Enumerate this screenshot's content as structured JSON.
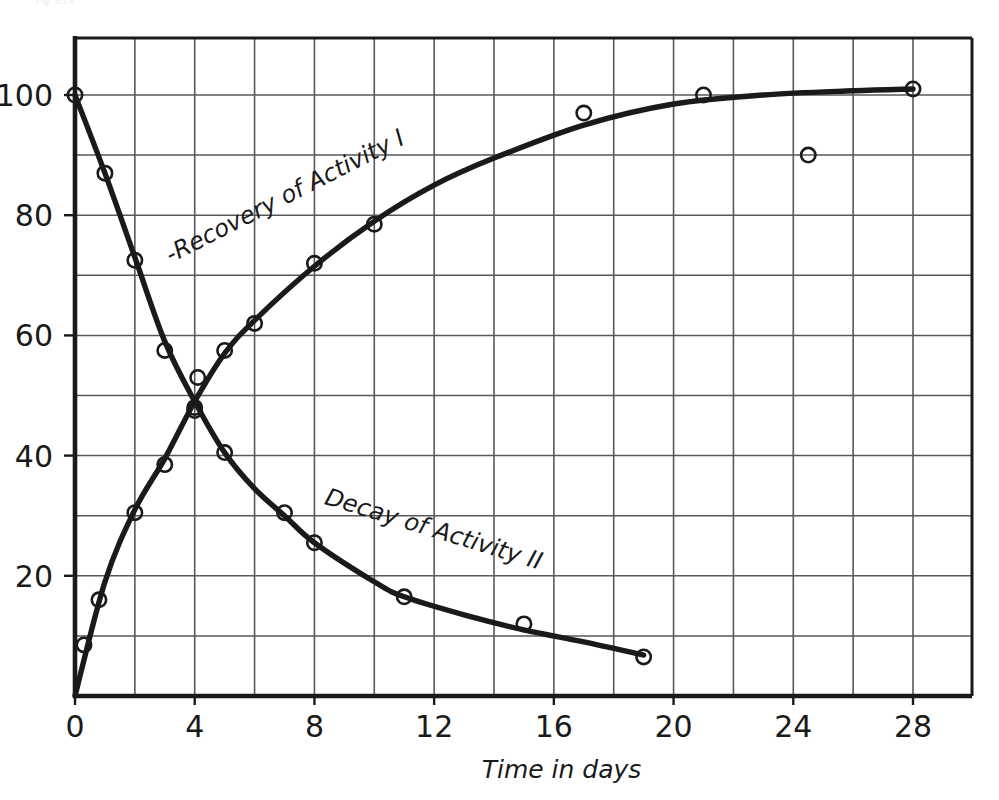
{
  "figure": {
    "faint_header": "Fig. 5.14",
    "background_color": "#ffffff",
    "ink_color": "#1a1a1a",
    "grid_color": "#58595b",
    "frame_color": "#1a1a1a"
  },
  "axes": {
    "x": {
      "title": "Time in days",
      "tick_labels": [
        "0",
        "4",
        "8",
        "12",
        "16",
        "20",
        "24",
        "28"
      ],
      "tick_values": [
        0,
        4,
        8,
        12,
        16,
        20,
        24,
        28
      ],
      "grid_step": 2,
      "range": [
        0,
        30
      ]
    },
    "y": {
      "title": "",
      "tick_labels": [
        "20",
        "40",
        "60",
        "80",
        "100"
      ],
      "tick_values": [
        20,
        40,
        60,
        80,
        100
      ],
      "grid_step": 10,
      "range": [
        0,
        110
      ]
    }
  },
  "annotations": [
    {
      "text": "-Recovery of Activity I",
      "x": 3.2,
      "y": 72,
      "rotation": -27
    },
    {
      "text": "Decay of Activity II",
      "x": 8.3,
      "y": 32,
      "rotation": 17
    }
  ],
  "chart_data": {
    "type": "scatter",
    "title": "",
    "subtitle": "",
    "xlabel": "Time in days",
    "ylabel": "",
    "xlim": [
      0,
      30
    ],
    "ylim": [
      0,
      110
    ],
    "grid": true,
    "legend": "inline-curve-labels",
    "marker": "open-circle",
    "series": [
      {
        "name": "Recovery of Activity I",
        "marker": "open-circle",
        "line": "smooth-rising-exponential",
        "points": [
          {
            "x": 0.3,
            "y": 8.5
          },
          {
            "x": 0.8,
            "y": 16
          },
          {
            "x": 2.0,
            "y": 30.5
          },
          {
            "x": 3.0,
            "y": 38.5
          },
          {
            "x": 4.0,
            "y": 47.5
          },
          {
            "x": 4.1,
            "y": 53
          },
          {
            "x": 5.0,
            "y": 57.5
          },
          {
            "x": 6.0,
            "y": 62
          },
          {
            "x": 8.0,
            "y": 72
          },
          {
            "x": 10.0,
            "y": 78.5
          },
          {
            "x": 17.0,
            "y": 97
          },
          {
            "x": 21.0,
            "y": 100
          },
          {
            "x": 24.5,
            "y": 90
          },
          {
            "x": 28.0,
            "y": 101
          }
        ],
        "curve": [
          {
            "x": 0.0,
            "y": 0
          },
          {
            "x": 1.0,
            "y": 19
          },
          {
            "x": 2.0,
            "y": 31
          },
          {
            "x": 3.0,
            "y": 39.5
          },
          {
            "x": 4.0,
            "y": 49
          },
          {
            "x": 5.0,
            "y": 57
          },
          {
            "x": 6.0,
            "y": 62.5
          },
          {
            "x": 8.0,
            "y": 71.5
          },
          {
            "x": 10.0,
            "y": 79
          },
          {
            "x": 12.0,
            "y": 85
          },
          {
            "x": 14.0,
            "y": 89.5
          },
          {
            "x": 17.0,
            "y": 95
          },
          {
            "x": 20.0,
            "y": 98.5
          },
          {
            "x": 23.0,
            "y": 100
          },
          {
            "x": 26.0,
            "y": 100.7
          },
          {
            "x": 28.0,
            "y": 101
          }
        ]
      },
      {
        "name": "Decay of Activity II",
        "marker": "open-circle",
        "line": "smooth-falling-exponential",
        "points": [
          {
            "x": 0.0,
            "y": 100
          },
          {
            "x": 1.0,
            "y": 87
          },
          {
            "x": 2.0,
            "y": 72.5
          },
          {
            "x": 3.0,
            "y": 57.5
          },
          {
            "x": 4.0,
            "y": 48
          },
          {
            "x": 5.0,
            "y": 40.5
          },
          {
            "x": 7.0,
            "y": 30.5
          },
          {
            "x": 8.0,
            "y": 25.5
          },
          {
            "x": 11.0,
            "y": 16.5
          },
          {
            "x": 15.0,
            "y": 12
          },
          {
            "x": 19.0,
            "y": 6.5
          }
        ],
        "curve": [
          {
            "x": 0.0,
            "y": 100
          },
          {
            "x": 1.0,
            "y": 87
          },
          {
            "x": 2.0,
            "y": 73
          },
          {
            "x": 3.0,
            "y": 59
          },
          {
            "x": 4.0,
            "y": 49
          },
          {
            "x": 5.0,
            "y": 40.5
          },
          {
            "x": 6.0,
            "y": 34.5
          },
          {
            "x": 7.0,
            "y": 30
          },
          {
            "x": 8.0,
            "y": 25.5
          },
          {
            "x": 10.0,
            "y": 19
          },
          {
            "x": 11.0,
            "y": 16.5
          },
          {
            "x": 13.0,
            "y": 13.5
          },
          {
            "x": 15.0,
            "y": 11
          },
          {
            "x": 17.0,
            "y": 9
          },
          {
            "x": 19.0,
            "y": 6.8
          }
        ]
      }
    ]
  }
}
